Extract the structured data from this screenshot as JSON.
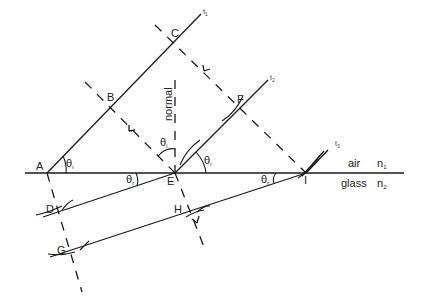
{
  "diagram": {
    "points": {
      "A": "A",
      "B": "B",
      "C": "C",
      "D": "D",
      "E": "E",
      "F": "F",
      "G": "G",
      "H": "H",
      "I": "I"
    },
    "wavefront_labels": {
      "t1": "t",
      "t1_sub": "1",
      "t2": "t",
      "t2_sub": "2",
      "t3": "t",
      "t3_sub": "3"
    },
    "normal_label": "normal",
    "angles": {
      "theta_i_A": "θ",
      "theta_i_A_sub": "i",
      "theta_i_E": "θ",
      "theta_i_E_sub": "i",
      "theta_i_normal": "θ",
      "theta_i_normal_sub": "i",
      "theta_r_E": "θ",
      "theta_r_E_sub": "r",
      "theta_r_I": "θ",
      "theta_r_I_sub": "r"
    },
    "media": {
      "upper": "air",
      "upper_index": "n",
      "upper_index_sub": "1",
      "lower": "glass",
      "lower_index": "n",
      "lower_index_sub": "2"
    }
  }
}
